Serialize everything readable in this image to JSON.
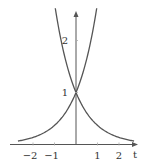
{
  "chart_data": {
    "type": "line",
    "title": "",
    "xlabel": "t",
    "ylabel": "",
    "xlim": [
      -3.0,
      2.8
    ],
    "ylim": [
      0,
      2.6
    ],
    "x_ticks": [
      -2,
      -1,
      1,
      2
    ],
    "x_tick_labels": [
      "−2",
      "−1",
      "1",
      "2"
    ],
    "y_ticks": [
      1,
      2
    ],
    "y_tick_labels": [
      "1",
      "2"
    ],
    "grid": false,
    "legend": null,
    "series": [
      {
        "name": "e^t",
        "function": "exp(t)",
        "x": [
          -3,
          -2,
          -1,
          0,
          0.5,
          0.95
        ],
        "values": [
          0.05,
          0.135,
          0.368,
          1.0,
          1.649,
          2.586
        ]
      },
      {
        "name": "e^-t",
        "function": "exp(-t)",
        "x": [
          -0.95,
          -0.5,
          0,
          1,
          2,
          2.8
        ],
        "values": [
          2.586,
          1.649,
          1.0,
          0.368,
          0.135,
          0.061
        ]
      }
    ],
    "annotations": [
      {
        "text": "intersection at (0, 1)"
      }
    ]
  },
  "style": {
    "line_color": "#555555",
    "axis_color": "#555555",
    "label_color": "#333333"
  }
}
